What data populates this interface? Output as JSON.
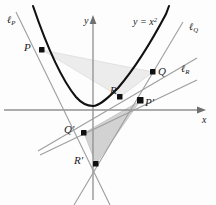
{
  "figure": {
    "background": "#fdfdfd",
    "axes": {
      "origin": [
        93,
        110
      ],
      "x_label": "x",
      "y_label": "y",
      "color": "#8c8c8c"
    },
    "curve": {
      "equation_label": "y = x",
      "equation_exponent": "2",
      "color": "#111111",
      "vertex": [
        93,
        105
      ]
    },
    "points": [
      {
        "id": "P",
        "label": "P",
        "prime": "",
        "x": 42,
        "y": 50,
        "label_x": 24,
        "label_y": 42
      },
      {
        "id": "Q",
        "label": "Q",
        "prime": "",
        "x": 153,
        "y": 72,
        "label_x": 158,
        "label_y": 66
      },
      {
        "id": "R",
        "label": "R",
        "prime": "",
        "x": 120,
        "y": 97,
        "label_x": 110,
        "label_y": 86
      },
      {
        "id": "Pp",
        "label": "P",
        "prime": "'",
        "x": 140,
        "y": 101,
        "label_x": 144,
        "label_y": 96
      },
      {
        "id": "Qp",
        "label": "Q",
        "prime": "'",
        "x": 84,
        "y": 133,
        "label_x": 64,
        "label_y": 124
      },
      {
        "id": "Rp",
        "label": "R",
        "prime": "'",
        "x": 96,
        "y": 164,
        "label_x": 74,
        "label_y": 155
      }
    ],
    "lines": [
      {
        "id": "lP",
        "label": "ℓ",
        "sub": "P",
        "label_x": 7,
        "label_y": 15
      },
      {
        "id": "lQ",
        "label": "ℓ",
        "sub": "Q",
        "label_x": 189,
        "label_y": 22
      },
      {
        "id": "lR",
        "label": "ℓ",
        "sub": "R",
        "label_x": 181,
        "label_y": 64
      }
    ],
    "shading": {
      "triangle_upper_fill": "#e9e9e9",
      "triangle_lower_fill": "#d4d4d4",
      "tangent_color": "#9a9a9a"
    }
  }
}
